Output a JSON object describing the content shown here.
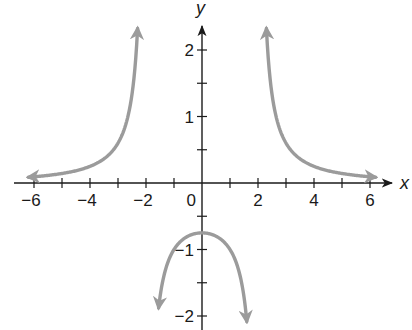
{
  "chart_data": {
    "type": "line",
    "title": "",
    "function": "y = 3/(x^2 - 4)",
    "xlabel": "x",
    "ylabel": "y",
    "xlim": [
      -6.5,
      7
    ],
    "ylim": [
      -2.2,
      2.4
    ],
    "x_ticks": [
      -6,
      -5,
      -4,
      -3,
      -2,
      -1,
      0,
      1,
      2,
      3,
      4,
      5,
      6
    ],
    "x_tick_labels": [
      "-6",
      "-4",
      "-2",
      "0",
      "2",
      "4",
      "6"
    ],
    "x_tick_label_values": [
      -6,
      -4,
      -2,
      0,
      2,
      4,
      6
    ],
    "y_ticks": [
      -2,
      -1.5,
      -1,
      -0.5,
      0.5,
      1,
      1.5,
      2
    ],
    "y_tick_labels": [
      "2",
      "1",
      "-1",
      "-2"
    ],
    "y_tick_label_values": [
      2,
      1,
      -1,
      -2
    ],
    "grid": false,
    "vertical_asymptotes": [
      -2,
      2
    ],
    "horizontal_asymptote": 0,
    "series": [
      {
        "name": "left branch",
        "x": [
          -6.0,
          -5.0,
          -4.0,
          -3.0,
          -2.5,
          -2.3
        ],
        "y": [
          0.09,
          0.14,
          0.25,
          0.6,
          1.33,
          2.33
        ]
      },
      {
        "name": "middle branch",
        "x": [
          -1.55,
          -1.0,
          -0.5,
          0.0,
          0.5,
          1.0,
          1.6
        ],
        "y": [
          -1.88,
          -1.0,
          -0.8,
          -0.75,
          -0.8,
          -1.0,
          -2.08
        ]
      },
      {
        "name": "right branch",
        "x": [
          2.3,
          2.5,
          3.0,
          4.0,
          5.0,
          6.0
        ],
        "y": [
          2.33,
          1.33,
          0.6,
          0.25,
          0.14,
          0.09
        ]
      }
    ],
    "curve_color": "#9b9b9b",
    "axis_color": "#1a1a1a"
  }
}
